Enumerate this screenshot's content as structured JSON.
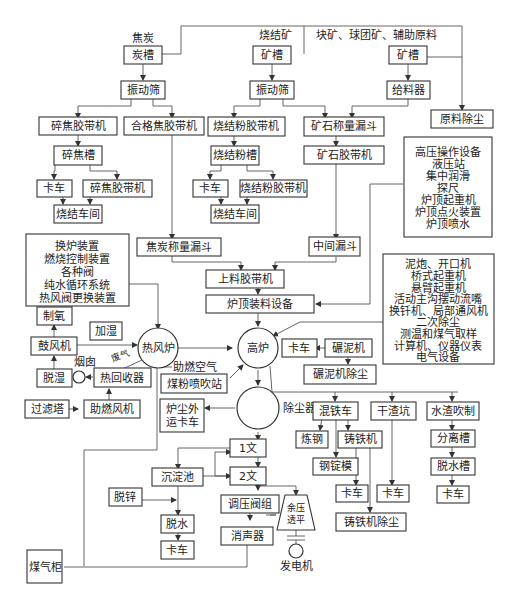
{
  "diagram": {
    "type": "blast furnace ironmaking process flow",
    "inputs": {
      "coke": "焦炭",
      "sinter": "烧结矿",
      "lump_pellet_aux": "块矿、球团矿、辅助原料"
    },
    "coke_line": {
      "bin": "炭槽",
      "screen": "振动筛",
      "fines_belt": "碎焦胶带机",
      "qualified_belt": "合格焦胶带机",
      "fines_bin": "碎焦槽",
      "truck": "卡车",
      "fines_belt2": "碎焦胶带机",
      "sinter_plant": "烧结车间",
      "weigh_hopper": "焦炭称量漏斗"
    },
    "sinter_line": {
      "bin": "矿槽",
      "screen": "振动筛",
      "fines_belt": "烧结粉胶带机",
      "fines_bin": "烧结粉槽",
      "truck": "卡车",
      "fines_belt2": "烧结粉胶带机",
      "sinter_plant": "烧结车间"
    },
    "ore_line": {
      "bin": "矿槽",
      "feeder": "给料器",
      "weigh_hopper": "矿石称量漏斗",
      "belt": "矿石胶带机",
      "mid_hopper": "中间漏斗",
      "dedust": "原料除尘"
    },
    "charging": {
      "belt": "上料胶带机",
      "top_equipment": "炉顶装料设备"
    },
    "top_equipment_list": [
      "高压操作设备",
      "液压站",
      "集中润滑",
      "探尺",
      "炉顶起重机",
      "炉顶点火装置",
      "炉顶喷水"
    ],
    "stove_equipment_list": [
      "换炉装置",
      "燃烧控制装置",
      "各种阀",
      "纯水循环系统",
      "热风阀更换装置"
    ],
    "casthouse_equipment_list": [
      "泥炮、开口机",
      "桥式起重机",
      "悬臂起重机",
      "活动主沟摆动流嘴",
      "换钎机、局部通风机",
      "二次除尘",
      "测温和煤气取样",
      "计算机、仪器仪表",
      "电气设备"
    ],
    "hot_blast": {
      "oxygen": "制氧",
      "humidify": "加湿",
      "blower": "鼓风机",
      "dehumidify": "脱湿",
      "stove": "热风炉",
      "chimney": "烟囱",
      "flue_gas": "废气",
      "heat_recovery": "热回收器",
      "combustion_air": "助燃空气",
      "filter_tower": "过滤塔",
      "combustion_fan": "助燃风机"
    },
    "furnace": {
      "blast_furnace": "高炉",
      "coal_injection": "煤粉喷吹站",
      "truck": "卡车",
      "mud_mixer": "碾泥机",
      "mud_dedust": "碾泥机除尘"
    },
    "gas_cleaning": {
      "dust_catcher": "除尘器",
      "dust_truck": "炉尘外运卡车",
      "venturi1": "1文",
      "venturi2": "2文",
      "settling_pond": "沉淀池",
      "dezinc": "脱锌",
      "dewater": "脱水",
      "truck": "卡车",
      "pressure_valve": "调压阀组",
      "silencer": "消声器",
      "trt": "余压透平",
      "generator": "发电机",
      "gas_holder": "煤气柜"
    },
    "products": {
      "torpedo_car": "混铁车",
      "steelmaking": "炼钢",
      "pig_machine": "铸铁机",
      "ingot_mold": "钢锭模",
      "truck1": "卡车",
      "truck2": "卡车",
      "pig_dedust": "铸铁机除尘",
      "dry_slag_pit": "干渣坑",
      "slag_granulation": "水渣吹制",
      "separation_tank": "分离槽",
      "dewater_tank": "脱水槽",
      "truck3": "卡车"
    }
  }
}
